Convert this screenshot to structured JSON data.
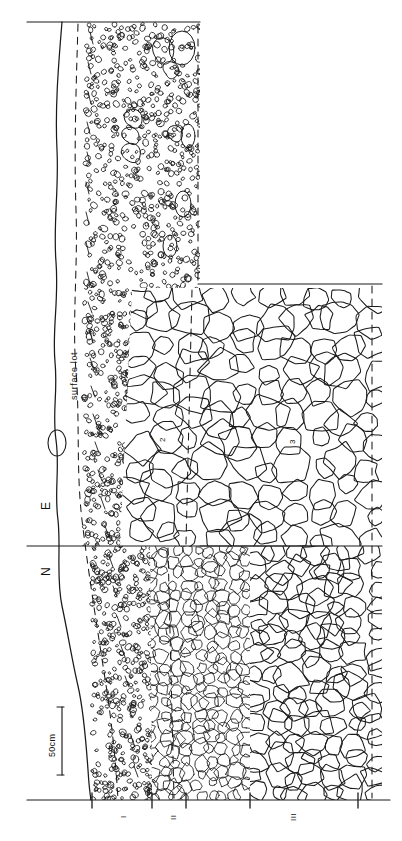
{
  "figure": {
    "kind": "stratigraphic-section-drawing",
    "orientation": "rotated-90-ccw",
    "background_color": "#ffffff",
    "ink_color": "#1a1a1a"
  },
  "labels": {
    "surface_lot": "surface lot",
    "direction_east": "E",
    "direction_north": "N",
    "scale_bar": "50cm",
    "unit_2": "2",
    "unit_3": "3",
    "roman_i": "I",
    "roman_ii": "II",
    "roman_iii": "III"
  },
  "scale": {
    "value": 50,
    "unit": "cm",
    "label": "50cm"
  },
  "sections": [
    {
      "id": "I",
      "name": "unit-I",
      "fill": "stipple-gravel",
      "note": "fine stippled sand/gravel matrix with occasional clasts"
    },
    {
      "id": "II",
      "name": "unit-II",
      "fill": "cobbles-medium",
      "note": "densely packed medium cobbles"
    },
    {
      "id": "III",
      "name": "unit-III",
      "fill": "cobbles-large",
      "note": "large angular cobbles/boulders"
    }
  ],
  "profile_units": [
    {
      "label": "2",
      "name": "numbered-unit-2"
    },
    {
      "label": "3",
      "name": "numbered-unit-3"
    }
  ],
  "boundaries": {
    "solid": "excavation-edge",
    "dashed": "inferred-unit-contact",
    "wavy": "ground-surface-profile"
  },
  "colors": {
    "ink": "#1a1a1a",
    "ink_light": "#4a4a4a",
    "paper": "#ffffff"
  }
}
